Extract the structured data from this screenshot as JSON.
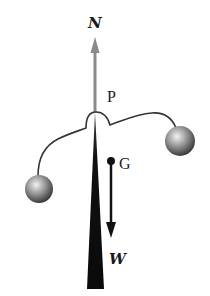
{
  "diagram": {
    "labels": {
      "normal_force": "N",
      "pivot": "P",
      "center_of_gravity": "G",
      "weight": "W"
    },
    "colors": {
      "background": "#ffffff",
      "stand": "#111111",
      "normal_arrow": "#8a8a8a",
      "weight_arrow": "#111111",
      "wire": "#333333",
      "ball_light": "#e6e6e6",
      "ball_dark": "#3a3a3a"
    },
    "elements": [
      {
        "name": "normal-force-arrow",
        "direction": "up",
        "label": "N"
      },
      {
        "name": "pivot-point",
        "label": "P"
      },
      {
        "name": "center-of-gravity",
        "label": "G"
      },
      {
        "name": "weight-arrow",
        "direction": "down",
        "label": "W"
      },
      {
        "name": "left-ball"
      },
      {
        "name": "right-ball"
      },
      {
        "name": "stand-wedge"
      }
    ]
  }
}
